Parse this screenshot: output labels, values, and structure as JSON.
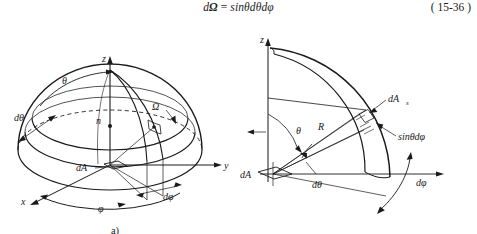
{
  "equation": {
    "d_symbol": "d",
    "omega": "Ω",
    "equals": "=",
    "rhs": "sinθdθdφ",
    "number": "( 15-36 )",
    "full_text": "dΩ = sinθdθdφ"
  },
  "figure_a": {
    "caption": "a)",
    "description": "Hemisphere with spherical coordinate solid angle element over surface dA",
    "labels": {
      "axis_z": "z",
      "axis_y": "y",
      "axis_x": "x",
      "theta": "θ",
      "d_theta": "dθ",
      "omega": "Ω",
      "normal": "n",
      "dA": "dA",
      "phi": "φ",
      "d_phi": "dφ"
    }
  },
  "figure_b": {
    "caption": "b)",
    "description": "Quarter-circle lune cross-section showing radius R, angle theta, element dAs",
    "labels": {
      "axis_z": "z",
      "theta": "θ",
      "d_theta": "dθ",
      "radius": "R",
      "dAs_main": "dA",
      "dAs_sub": "s",
      "sin_theta_dphi": "sinθdφ",
      "dA": "dA",
      "d_phi": "dφ"
    }
  },
  "colors": {
    "ink": "#1a1a1a",
    "background": "#ffffff",
    "light_rule": "#555555"
  }
}
